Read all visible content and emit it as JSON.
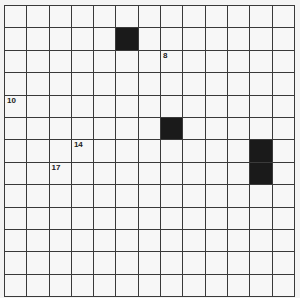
{
  "puzzle": {
    "rows": 13,
    "cols": 13,
    "black_cells": [
      [
        1,
        5
      ],
      [
        5,
        7
      ],
      [
        6,
        11
      ],
      [
        7,
        11
      ]
    ],
    "numbers": [
      {
        "row": 2,
        "col": 7,
        "label": "8"
      },
      {
        "row": 4,
        "col": 0,
        "label": "10"
      },
      {
        "row": 6,
        "col": 3,
        "label": "14"
      },
      {
        "row": 7,
        "col": 2,
        "label": "17"
      }
    ],
    "colors": {
      "grid_line": "#3a3a3a",
      "black_cell": "#1a1a1a",
      "white_cell": "#f7f7f7"
    }
  }
}
